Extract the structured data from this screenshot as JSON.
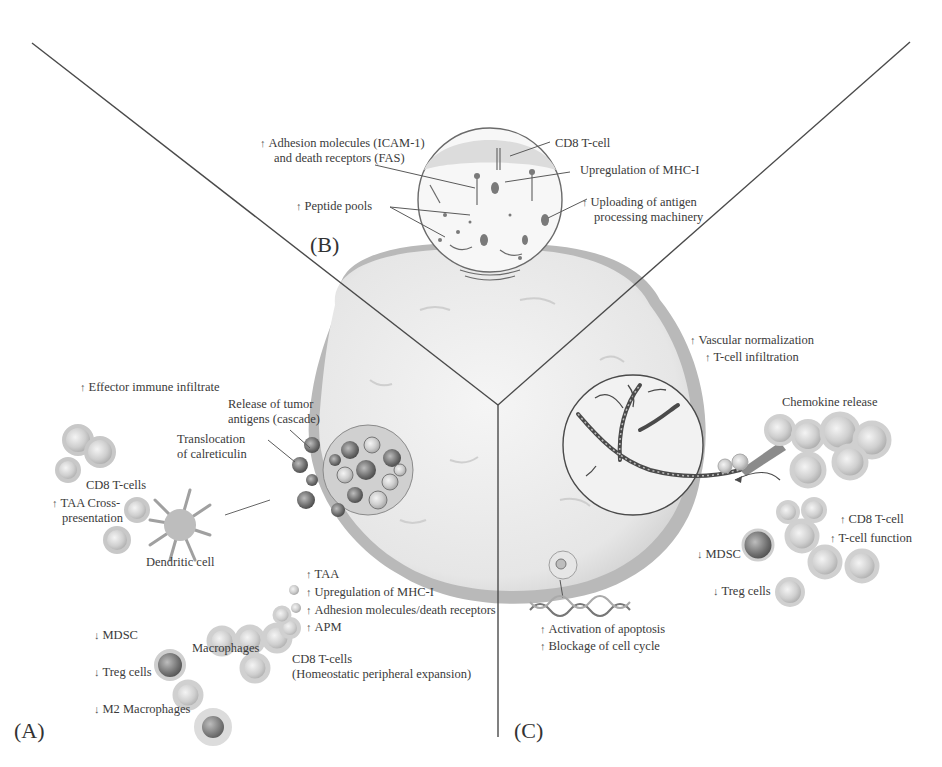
{
  "figure": {
    "panels": [
      {
        "id": "A",
        "label": "(A)"
      },
      {
        "id": "B",
        "label": "(B)"
      },
      {
        "id": "C",
        "label": "(C)"
      }
    ],
    "symbols": {
      "up": "↑",
      "down": "↓"
    },
    "colors": {
      "divider": "#4a4a4a",
      "tumor_fill": "#ececec",
      "tumor_rim": "#b5b5b5",
      "cell_fill": "#d4d4d4",
      "cell_dark": "#7a7a7a",
      "text": "#3a3a3a"
    }
  },
  "panel_b": {
    "labels": {
      "adhesion_line1": "Adhesion molecules (ICAM-1)",
      "adhesion_line2": "and death receptors (FAS)",
      "cd8": "CD8 T-cell",
      "mhc": "Upregulation of MHC-I",
      "peptide": "Peptide pools",
      "uploading_line1": "Uploading of antigen",
      "uploading_line2": "processing machinery"
    }
  },
  "panel_c": {
    "labels": {
      "vascular": "Vascular normalization",
      "infiltration": "T-cell infiltration",
      "chemokine": "Chemokine release",
      "cd8": "CD8 T-cell",
      "function": "T-cell function",
      "mdsc": "MDSC",
      "treg": "Treg cells",
      "apoptosis": "Activation of apoptosis",
      "cellcycle": "Blockage of cell cycle"
    }
  },
  "panel_a": {
    "labels": {
      "effector": "Effector immune infiltrate",
      "release_line1": "Release of tumor",
      "release_line2": "antigens (cascade)",
      "translocation_line1": "Translocation",
      "translocation_line2": "of calreticulin",
      "cd8_cells": "CD8 T-cells",
      "taa_cross_line1": "TAA Cross-",
      "taa_cross_line2": "presentation",
      "dendritic": "Dendritic cell",
      "taa": "TAA",
      "mhc": "Upregulation of MHC-I",
      "adhesion": "Adhesion molecules/death receptors",
      "apm": "APM",
      "mdsc": "MDSC",
      "macrophages": "Macrophages",
      "cd8_homeo_line1": "CD8 T-cells",
      "cd8_homeo_line2": "(Homeostatic peripheral expansion)",
      "treg": "Treg cells",
      "m2": "M2 Macrophages"
    }
  }
}
